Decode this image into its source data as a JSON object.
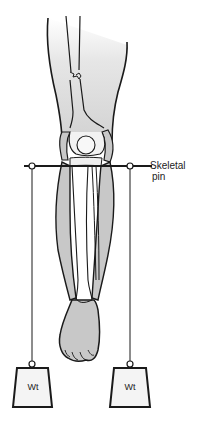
{
  "figure": {
    "labels": {
      "pin_line1": "Skeletal",
      "pin_line2": "pin",
      "weight_left": "Wt",
      "weight_right": "Wt"
    },
    "colors": {
      "outline": "#1a1a1a",
      "soft_tissue": "#c8c8c8",
      "skin_gradient_top": "#ffffff",
      "skin_gradient_bottom": "#d4d4d4",
      "weight_fill": "#f4f4f4"
    }
  }
}
